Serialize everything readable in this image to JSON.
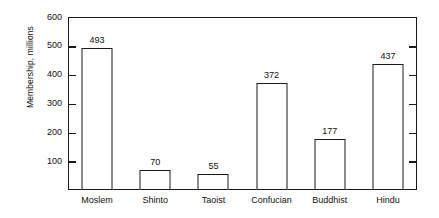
{
  "chart_data": {
    "type": "bar",
    "title": "",
    "subtitle": "",
    "xlabel": "",
    "ylabel": "Membership, millions",
    "categories": [
      "Moslem",
      "Shinto",
      "Taoist",
      "Confucian",
      "Buddhist",
      "Hindu"
    ],
    "values": [
      493,
      70,
      55,
      372,
      177,
      437
    ],
    "data_labels": [
      "493",
      "70",
      "55",
      "372",
      "177",
      "437"
    ],
    "ylim": [
      0,
      600
    ],
    "ytick_values": [
      100,
      200,
      300,
      400,
      500,
      600
    ],
    "ytick_labels": [
      "100",
      "200",
      "300",
      "400",
      "500",
      "600"
    ],
    "grid": false,
    "legend": null,
    "legend_position": "none",
    "annotations": [],
    "bar_fill_color": "#ffffff",
    "bar_edge_color": "#1a1a1a",
    "axis_color": "#1a1a1a",
    "text_color": "#111111",
    "background_color": "#ffffff",
    "ticks_direction": "in",
    "ticks_sides": [
      "left",
      "right"
    ],
    "frame": "full"
  }
}
